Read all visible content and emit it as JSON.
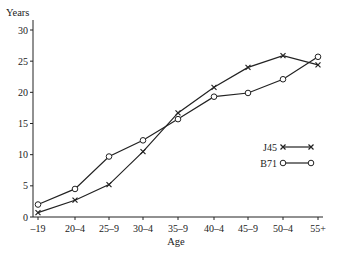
{
  "chart_data": {
    "type": "line",
    "title": "",
    "xlabel": "Age",
    "ylabel": "Years",
    "categories": [
      "-19",
      "20-4",
      "25-9",
      "30-4",
      "35-9",
      "40-4",
      "45-9",
      "50-4",
      "55+"
    ],
    "category_labels": [
      "–19",
      "20–4",
      "25–9",
      "30–4",
      "35–9",
      "40–4",
      "45–9",
      "50–4",
      "55+"
    ],
    "series": [
      {
        "name": "J45",
        "marker": "cross",
        "values": [
          0.7,
          2.7,
          5.2,
          10.5,
          16.7,
          20.8,
          24.0,
          25.9,
          24.4
        ]
      },
      {
        "name": "B71",
        "marker": "open-circle",
        "values": [
          2.0,
          4.5,
          9.7,
          12.3,
          15.7,
          19.3,
          19.9,
          22.1,
          25.7
        ]
      }
    ],
    "ylim": [
      0,
      30
    ],
    "yticks": [
      0,
      5,
      10,
      15,
      20,
      25,
      30
    ],
    "grid": false,
    "legend_position": "right-center"
  },
  "colors": {
    "line": "#222222",
    "background": "#ffffff"
  }
}
